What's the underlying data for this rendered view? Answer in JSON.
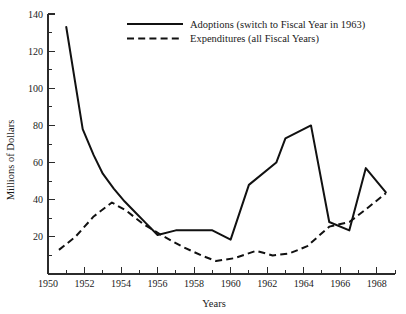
{
  "chart_data": {
    "type": "line",
    "title": "",
    "xlabel": "Years",
    "ylabel": "Millions of Dollars",
    "xlim": [
      1950,
      1969
    ],
    "ylim": [
      0,
      140
    ],
    "grid": false,
    "legend_position": "top-center",
    "y_ticks_major": [
      0,
      20,
      40,
      60,
      80,
      100,
      120,
      140
    ],
    "y_tick_labels": [
      "",
      "20",
      "40",
      "60",
      "80",
      "100",
      "120",
      "140"
    ],
    "y_ticks_minor": [
      10,
      30,
      50,
      70,
      90,
      110,
      130
    ],
    "x_ticks_major": [
      1950,
      1952,
      1954,
      1956,
      1958,
      1960,
      1962,
      1964,
      1966,
      1968
    ],
    "x_tick_labels": [
      "1950",
      "1952",
      "1954",
      "1956",
      "1958",
      "1960",
      "1962",
      "1964",
      "1966",
      "1968"
    ],
    "x_ticks_minor": [
      1951,
      1953,
      1955,
      1957,
      1959,
      1961,
      1963,
      1965,
      1967,
      1969
    ],
    "series": [
      {
        "name": "Adoptions (switch to Fiscal Year in 1963)",
        "style": "solid",
        "x": [
          1951.0,
          1951.9,
          1952.5,
          1953.0,
          1953.6,
          1954.2,
          1954.8,
          1955.4,
          1956.0,
          1957.0,
          1959.0,
          1960.0,
          1961.0,
          1962.5,
          1963.0,
          1964.4,
          1965.4,
          1966.5,
          1967.4,
          1968.5
        ],
        "y": [
          133,
          78,
          64,
          54,
          46,
          39,
          33,
          27,
          21,
          23.5,
          23.5,
          18.5,
          48,
          60,
          73,
          80,
          28,
          23.5,
          57,
          44
        ]
      },
      {
        "name": "Expenditures (all Fiscal Years)",
        "style": "dashed",
        "x": [
          1950.6,
          1951.5,
          1952.5,
          1953.5,
          1954.3,
          1955.2,
          1956.2,
          1957.3,
          1958.4,
          1959.2,
          1960.2,
          1961.4,
          1962.3,
          1963.2,
          1964.2,
          1965.4,
          1966.5,
          1967.3,
          1968.5
        ],
        "y": [
          13,
          20,
          31,
          38.5,
          34,
          27,
          21,
          15,
          10,
          7,
          8.5,
          12.5,
          10,
          11,
          15,
          25.5,
          28,
          34,
          43.5
        ]
      }
    ]
  },
  "legend": {
    "entries": [
      {
        "label": "Adoptions (switch to Fiscal Year in 1963)",
        "style": "solid"
      },
      {
        "label": "Expenditures (all Fiscal Years)",
        "style": "dashed"
      }
    ]
  }
}
